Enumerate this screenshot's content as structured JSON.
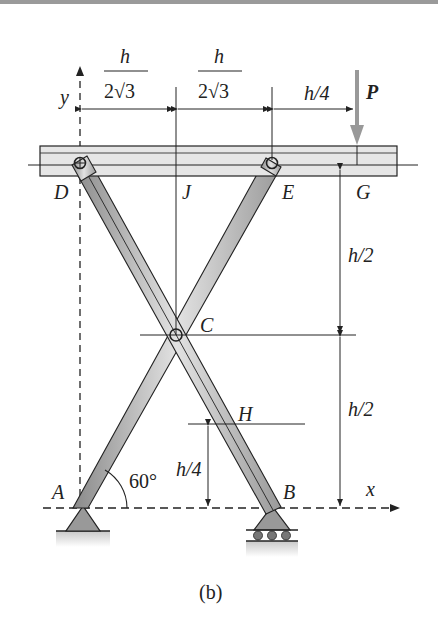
{
  "figure": {
    "caption": "(b)",
    "axes": {
      "x": "x",
      "y": "y"
    },
    "points": {
      "A": "A",
      "B": "B",
      "C": "C",
      "D": "D",
      "E": "E",
      "G": "G",
      "H": "H",
      "J": "J"
    },
    "load": {
      "label": "P",
      "color": "#9a9a9a"
    },
    "angle": "60°",
    "dimensions": {
      "dj_num": "h",
      "dj_den": "2√3",
      "je_num": "h",
      "je_den": "2√3",
      "eg": "h/4",
      "upper_half": "h/2",
      "lower_half": "h/2",
      "h_height": "h/4"
    }
  }
}
